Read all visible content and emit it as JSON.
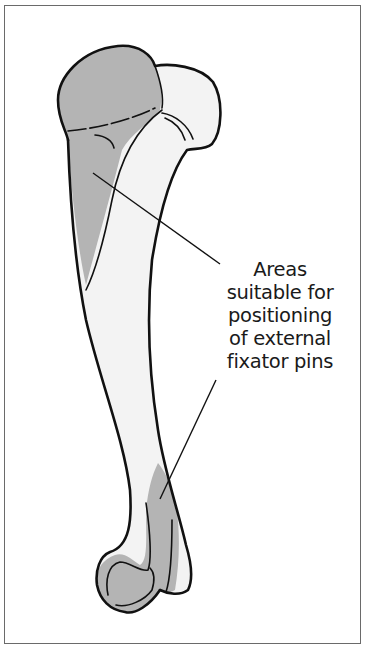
{
  "figure": {
    "label_lines": [
      "Areas",
      "suitable for",
      "positioning",
      "of external",
      "fixator pins"
    ],
    "colors": {
      "outline": "#111111",
      "shaded_zone": "#b4b4b4",
      "bone_fill": "#f3f3f3",
      "frame": "#6a6a6a",
      "background": "#ffffff"
    },
    "zones": [
      {
        "name": "proximal-zone",
        "location": "humeral head and lateral proximal shaft"
      },
      {
        "name": "distal-zone",
        "location": "distal lateral shaft and lateral condyle"
      }
    ]
  }
}
